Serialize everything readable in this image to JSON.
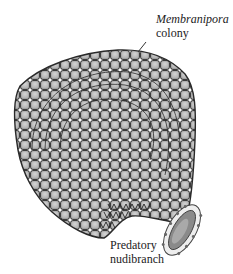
{
  "labels": {
    "colony_name": "Membranipora",
    "colony_word": "colony",
    "predator_line1": "Predatory",
    "predator_line2": "nudibranch"
  },
  "colors": {
    "cell_fill": "#b8b8b8",
    "cell_stroke": "#2a2a2a",
    "background": "#ffffff"
  }
}
